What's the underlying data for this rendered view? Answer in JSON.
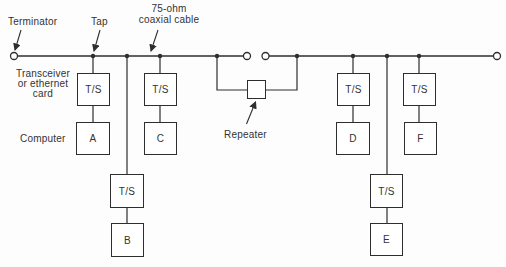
{
  "labels": {
    "terminator": "Terminator",
    "tap": "Tap",
    "cable": "75-ohm\ncoaxial cable",
    "transceiver": "Transceiver\nor ethernet\ncard",
    "computer": "Computer",
    "repeater": "Repeater",
    "ts": "T/S"
  },
  "computers": [
    "A",
    "B",
    "C",
    "D",
    "E",
    "F"
  ],
  "colors": {
    "line": "#2e2e2e",
    "text": "#333333",
    "background": "#fdfdfd",
    "box_fill": "#ffffff"
  }
}
